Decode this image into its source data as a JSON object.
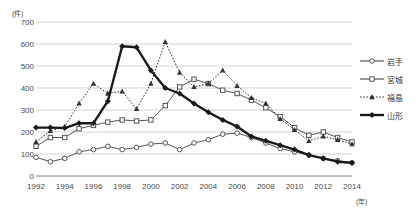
{
  "axes": {
    "y_unit": "(件)",
    "x_unit": "(年)",
    "y_ticks": [
      "0",
      "100",
      "200",
      "300",
      "400",
      "500",
      "600",
      "700"
    ],
    "x_ticks": [
      "1992",
      "1994",
      "1996",
      "1998",
      "2000",
      "2002",
      "2004",
      "2006",
      "2008",
      "2010",
      "2012",
      "2014"
    ]
  },
  "legend": {
    "items": [
      {
        "label": "岩手",
        "marker": "open-circle",
        "color": "#555555",
        "dash": "solid"
      },
      {
        "label": "宮城",
        "marker": "open-square",
        "color": "#555555",
        "dash": "solid"
      },
      {
        "label": "福島",
        "marker": "filled-triangle",
        "color": "#333333",
        "dash": "dotted"
      },
      {
        "label": "山形",
        "marker": "filled-diamond",
        "color": "#1a1a1a",
        "dash": "solid-bold"
      }
    ]
  },
  "chart_data": {
    "type": "line",
    "title": "",
    "xlabel": "(年)",
    "ylabel": "(件)",
    "xlim": [
      1992,
      2014
    ],
    "ylim": [
      0,
      700
    ],
    "ytick_step": 100,
    "grid": true,
    "legend_position": "right",
    "x": [
      1992,
      1993,
      1994,
      1995,
      1996,
      1997,
      1998,
      1999,
      2000,
      2001,
      2002,
      2003,
      2004,
      2005,
      2006,
      2007,
      2008,
      2009,
      2010,
      2011,
      2012,
      2013,
      2014
    ],
    "series": [
      {
        "name": "岩手",
        "marker": "open-circle",
        "color": "#555555",
        "dash": "solid",
        "values": [
          85,
          65,
          80,
          110,
          120,
          135,
          120,
          130,
          145,
          150,
          120,
          150,
          165,
          190,
          195,
          175,
          150,
          125,
          110,
          95,
          80,
          70,
          60
        ]
      },
      {
        "name": "宮城",
        "marker": "open-square",
        "color": "#555555",
        "dash": "solid",
        "values": [
          135,
          175,
          175,
          215,
          230,
          245,
          255,
          250,
          255,
          320,
          405,
          440,
          420,
          390,
          375,
          345,
          310,
          270,
          220,
          185,
          200,
          175,
          155
        ]
      },
      {
        "name": "福島",
        "marker": "filled-triangle",
        "color": "#333333",
        "dash": "dotted",
        "values": [
          155,
          205,
          225,
          330,
          420,
          375,
          385,
          305,
          420,
          610,
          470,
          405,
          420,
          480,
          410,
          355,
          330,
          260,
          210,
          160,
          180,
          165,
          145
        ]
      },
      {
        "name": "山形",
        "marker": "filled-diamond",
        "color": "#1a1a1a",
        "dash": "solid-bold",
        "values": [
          220,
          220,
          218,
          240,
          240,
          340,
          590,
          585,
          480,
          400,
          375,
          330,
          290,
          255,
          225,
          180,
          160,
          140,
          120,
          95,
          80,
          65,
          60
        ]
      }
    ]
  }
}
